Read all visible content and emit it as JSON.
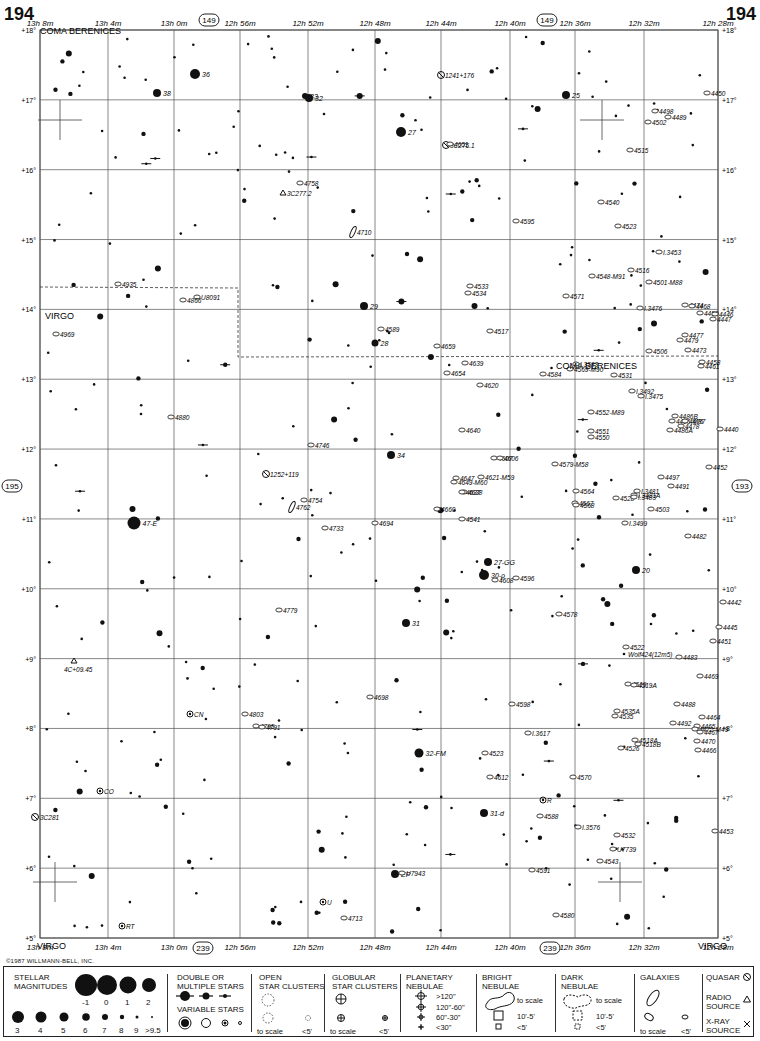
{
  "page": {
    "number_left": "194",
    "number_right": "194",
    "copyright": "©1987 WILLMANN-BELL, INC."
  },
  "chart_data": {
    "type": "scatter",
    "xlabel": "Right Ascension",
    "ylabel": "Declination",
    "ra_ticks_top": [
      "13h 8m",
      "13h 4m",
      "13h 0m",
      "12h 56m",
      "12h 52m",
      "12h 48m",
      "12h 44m",
      "12h 40m",
      "12h 36m",
      "12h 32m",
      "12h 28m"
    ],
    "ra_ticks_bottom": [
      "13h 8m",
      "13h 4m",
      "13h 0m",
      "12h 56m",
      "12h 52m",
      "12h 48m",
      "12h 44m",
      "12h 40m",
      "12h 36m",
      "12h 32m",
      "12h 28m"
    ],
    "dec_ticks": [
      "+18°",
      "+17°",
      "+16°",
      "+15°",
      "+14°",
      "+13°",
      "+12°",
      "+11°",
      "+10°",
      "+9°",
      "+8°",
      "+7°",
      "+6°",
      "+5°"
    ],
    "xlim_ra_min": [
      788,
      748
    ],
    "ylim_dec": [
      5,
      18
    ],
    "grid": true,
    "adjacent_charts": {
      "top": "149",
      "bottom": "239",
      "left": "195",
      "right": "193"
    },
    "constellations": [
      {
        "name": "COMA BERENICES",
        "x": 40,
        "y": 14
      },
      {
        "name": "VIRGO",
        "x": 45,
        "y": 299
      },
      {
        "name": "COMA BERENICES",
        "x": 556,
        "y": 349
      },
      {
        "name": "VIRGO",
        "x": 37,
        "y": 929
      },
      {
        "name": "VIRGO",
        "x": 698,
        "y": 929
      }
    ],
    "labeled_stars": [
      {
        "label": "36",
        "x": 195,
        "y": 74,
        "r": 5
      },
      {
        "label": "38",
        "x": 157,
        "y": 93,
        "r": 4
      },
      {
        "label": "33",
        "x": 305,
        "y": 96,
        "r": 3
      },
      {
        "label": "32",
        "x": 309,
        "y": 98,
        "r": 4
      },
      {
        "label": "25",
        "x": 566,
        "y": 95,
        "r": 4
      },
      {
        "label": "27",
        "x": 401,
        "y": 132,
        "r": 5
      },
      {
        "label": "29",
        "x": 364,
        "y": 306,
        "r": 4
      },
      {
        "label": "28",
        "x": 375,
        "y": 343,
        "r": 3.5
      },
      {
        "label": "34",
        "x": 391,
        "y": 455,
        "r": 4
      },
      {
        "label": "47-E",
        "x": 134,
        "y": 523,
        "r": 6.5
      },
      {
        "label": "27-GG",
        "x": 488,
        "y": 562,
        "r": 4
      },
      {
        "label": "30-ρ",
        "x": 484,
        "y": 575,
        "r": 5
      },
      {
        "label": "20",
        "x": 636,
        "y": 570,
        "r": 4
      },
      {
        "label": "31",
        "x": 406,
        "y": 623,
        "r": 4
      },
      {
        "label": "32-FM",
        "x": 419,
        "y": 753,
        "r": 4.5
      },
      {
        "label": "31-d",
        "x": 484,
        "y": 813,
        "r": 4
      },
      {
        "label": "EP",
        "x": 395,
        "y": 874,
        "r": 4
      }
    ],
    "galaxies": [
      {
        "label": "1241+176",
        "x": 441,
        "y": 75,
        "kind": "quasar"
      },
      {
        "label": "4450",
        "x": 707,
        "y": 93
      },
      {
        "label": "4498",
        "x": 655,
        "y": 111
      },
      {
        "label": "4489",
        "x": 668,
        "y": 117
      },
      {
        "label": "4502",
        "x": 648,
        "y": 122
      },
      {
        "label": "3C275.1",
        "x": 446,
        "y": 145,
        "kind": "quasar"
      },
      {
        "label": "4651",
        "x": 450,
        "y": 144
      },
      {
        "label": "4515",
        "x": 630,
        "y": 150
      },
      {
        "label": "4758",
        "x": 300,
        "y": 183
      },
      {
        "label": "3C277.2",
        "x": 283,
        "y": 193,
        "kind": "radio"
      },
      {
        "label": "4540",
        "x": 601,
        "y": 202
      },
      {
        "label": "4595",
        "x": 516,
        "y": 221
      },
      {
        "label": "4523",
        "x": 618,
        "y": 226
      },
      {
        "label": "4710",
        "x": 353,
        "y": 232,
        "rot": true
      },
      {
        "label": "I.3453",
        "x": 659,
        "y": 252
      },
      {
        "label": "4516",
        "x": 631,
        "y": 270
      },
      {
        "label": "4548-M91",
        "x": 592,
        "y": 276
      },
      {
        "label": "4501-M88",
        "x": 649,
        "y": 282
      },
      {
        "label": "4935",
        "x": 118,
        "y": 284
      },
      {
        "label": "4533",
        "x": 470,
        "y": 286
      },
      {
        "label": "4534",
        "x": 468,
        "y": 293
      },
      {
        "label": "U8091",
        "x": 197,
        "y": 297
      },
      {
        "label": "4866",
        "x": 183,
        "y": 300
      },
      {
        "label": "4571",
        "x": 566,
        "y": 296
      },
      {
        "label": "I.3476",
        "x": 640,
        "y": 308
      },
      {
        "label": "4474",
        "x": 685,
        "y": 305
      },
      {
        "label": "4468",
        "x": 692,
        "y": 306
      },
      {
        "label": "4459",
        "x": 700,
        "y": 313
      },
      {
        "label": "4446",
        "x": 715,
        "y": 314
      },
      {
        "label": "4447",
        "x": 713,
        "y": 319
      },
      {
        "label": "4969",
        "x": 56,
        "y": 334
      },
      {
        "label": "4589",
        "x": 381,
        "y": 329
      },
      {
        "label": "4517",
        "x": 490,
        "y": 331
      },
      {
        "label": "4659",
        "x": 437,
        "y": 346
      },
      {
        "label": "4477",
        "x": 685,
        "y": 335
      },
      {
        "label": "4479",
        "x": 680,
        "y": 340
      },
      {
        "label": "4506",
        "x": 649,
        "y": 351
      },
      {
        "label": "4473",
        "x": 688,
        "y": 350
      },
      {
        "label": "4639",
        "x": 465,
        "y": 363
      },
      {
        "label": "I.3583",
        "x": 576,
        "y": 364
      },
      {
        "label": "4569-M90",
        "x": 570,
        "y": 369
      },
      {
        "label": "4654",
        "x": 447,
        "y": 373
      },
      {
        "label": "4584",
        "x": 543,
        "y": 374
      },
      {
        "label": "4531",
        "x": 614,
        "y": 375
      },
      {
        "label": "4458",
        "x": 702,
        "y": 362
      },
      {
        "label": "4461",
        "x": 701,
        "y": 366
      },
      {
        "label": "4620",
        "x": 480,
        "y": 385
      },
      {
        "label": "I.3492",
        "x": 632,
        "y": 391
      },
      {
        "label": "I.3475",
        "x": 641,
        "y": 396
      },
      {
        "label": "4552-M89",
        "x": 591,
        "y": 412
      },
      {
        "label": "4880",
        "x": 171,
        "y": 417
      },
      {
        "label": "4486B",
        "x": 675,
        "y": 416
      },
      {
        "label": "4486-M87",
        "x": 672,
        "y": 421
      },
      {
        "label": "4476",
        "x": 685,
        "y": 421
      },
      {
        "label": "4486A",
        "x": 670,
        "y": 430
      },
      {
        "label": "4478",
        "x": 681,
        "y": 426
      },
      {
        "label": "4440",
        "x": 720,
        "y": 429
      },
      {
        "label": "4551",
        "x": 591,
        "y": 431
      },
      {
        "label": "4550",
        "x": 591,
        "y": 437
      },
      {
        "label": "4640",
        "x": 462,
        "y": 430
      },
      {
        "label": "4746",
        "x": 311,
        "y": 445
      },
      {
        "label": "4607",
        "x": 494,
        "y": 458
      },
      {
        "label": "4606",
        "x": 500,
        "y": 458
      },
      {
        "label": "4579-M58",
        "x": 555,
        "y": 464
      },
      {
        "label": "4452",
        "x": 709,
        "y": 467
      },
      {
        "label": "4497",
        "x": 661,
        "y": 477
      },
      {
        "label": "1252+119",
        "x": 266,
        "y": 474,
        "kind": "quasar"
      },
      {
        "label": "4647",
        "x": 456,
        "y": 478
      },
      {
        "label": "4621-M59",
        "x": 481,
        "y": 477
      },
      {
        "label": "4649-M60",
        "x": 454,
        "y": 482
      },
      {
        "label": "4638",
        "x": 464,
        "y": 492
      },
      {
        "label": "4637",
        "x": 462,
        "y": 492
      },
      {
        "label": "4564",
        "x": 576,
        "y": 491
      },
      {
        "label": "I.3481A",
        "x": 634,
        "y": 495
      },
      {
        "label": "I.3481",
        "x": 637,
        "y": 491
      },
      {
        "label": "4528",
        "x": 616,
        "y": 498
      },
      {
        "label": "I.3483",
        "x": 634,
        "y": 497
      },
      {
        "label": "4491",
        "x": 671,
        "y": 486
      },
      {
        "label": "4754",
        "x": 304,
        "y": 500
      },
      {
        "label": "4762",
        "x": 292,
        "y": 507,
        "rot": true
      },
      {
        "label": "4567",
        "x": 575,
        "y": 503
      },
      {
        "label": "4568",
        "x": 576,
        "y": 505
      },
      {
        "label": "4660",
        "x": 437,
        "y": 509
      },
      {
        "label": "4503",
        "x": 651,
        "y": 509
      },
      {
        "label": "4694",
        "x": 375,
        "y": 523
      },
      {
        "label": "4541",
        "x": 462,
        "y": 519
      },
      {
        "label": "I.3499",
        "x": 625,
        "y": 523
      },
      {
        "label": "4733",
        "x": 325,
        "y": 528
      },
      {
        "label": "4482",
        "x": 688,
        "y": 536
      },
      {
        "label": "4608",
        "x": 495,
        "y": 580
      },
      {
        "label": "4596",
        "x": 516,
        "y": 578
      },
      {
        "label": "4442",
        "x": 723,
        "y": 602
      },
      {
        "label": "4779",
        "x": 279,
        "y": 610
      },
      {
        "label": "4578",
        "x": 559,
        "y": 614
      },
      {
        "label": "4445",
        "x": 719,
        "y": 627
      },
      {
        "label": "4451",
        "x": 713,
        "y": 641
      },
      {
        "label": "4522",
        "x": 626,
        "y": 647
      },
      {
        "label": "Wolf424(12m5)",
        "x": 624,
        "y": 654,
        "kind": "star"
      },
      {
        "label": "4483",
        "x": 679,
        "y": 657
      },
      {
        "label": "4469",
        "x": 700,
        "y": 676
      },
      {
        "label": "4519",
        "x": 628,
        "y": 684
      },
      {
        "label": "4519A",
        "x": 634,
        "y": 685
      },
      {
        "label": "4698",
        "x": 370,
        "y": 697
      },
      {
        "label": "4488",
        "x": 677,
        "y": 704
      },
      {
        "label": "4598",
        "x": 512,
        "y": 704
      },
      {
        "label": "4803",
        "x": 245,
        "y": 714
      },
      {
        "label": "4535A",
        "x": 617,
        "y": 711
      },
      {
        "label": "4535",
        "x": 615,
        "y": 716
      },
      {
        "label": "4464",
        "x": 702,
        "y": 717
      },
      {
        "label": "4492",
        "x": 673,
        "y": 723
      },
      {
        "label": "4795",
        "x": 256,
        "y": 726
      },
      {
        "label": "4791",
        "x": 262,
        "y": 727
      },
      {
        "label": "4465",
        "x": 697,
        "y": 726
      },
      {
        "label": "4472-M49",
        "x": 695,
        "y": 729
      },
      {
        "label": "4467",
        "x": 700,
        "y": 732
      },
      {
        "label": "I.3617",
        "x": 528,
        "y": 733
      },
      {
        "label": "4518A",
        "x": 635,
        "y": 740
      },
      {
        "label": "4518B",
        "x": 638,
        "y": 744
      },
      {
        "label": "4470",
        "x": 697,
        "y": 741
      },
      {
        "label": "4526",
        "x": 621,
        "y": 748
      },
      {
        "label": "4466",
        "x": 698,
        "y": 750
      },
      {
        "label": "4523",
        "x": 485,
        "y": 753
      },
      {
        "label": "4612",
        "x": 490,
        "y": 777
      },
      {
        "label": "4570",
        "x": 573,
        "y": 777
      },
      {
        "label": "4588",
        "x": 540,
        "y": 816
      },
      {
        "label": "I.3576",
        "x": 578,
        "y": 827
      },
      {
        "label": "4532",
        "x": 617,
        "y": 835
      },
      {
        "label": "4453",
        "x": 715,
        "y": 831
      },
      {
        "label": "U7739",
        "x": 613,
        "y": 849
      },
      {
        "label": "4543",
        "x": 600,
        "y": 861
      },
      {
        "label": "4591",
        "x": 532,
        "y": 870
      },
      {
        "label": "U7943",
        "x": 402,
        "y": 873
      },
      {
        "label": "4580",
        "x": 556,
        "y": 915
      },
      {
        "label": "4713",
        "x": 344,
        "y": 918
      }
    ],
    "variable_stars": [
      {
        "label": "CN",
        "x": 190,
        "y": 714
      },
      {
        "label": "CO",
        "x": 100,
        "y": 791
      },
      {
        "label": "RT",
        "x": 122,
        "y": 926
      },
      {
        "label": "U",
        "x": 323,
        "y": 902
      },
      {
        "label": "R",
        "x": 543,
        "y": 800
      }
    ],
    "radio_sources": [
      {
        "label": "3C277.2",
        "x": 283,
        "y": 193
      },
      {
        "label": "4C+09.45",
        "x": 74,
        "y": 661
      }
    ],
    "quasars": [
      {
        "label": "1241+176",
        "x": 441,
        "y": 75
      },
      {
        "label": "3C275.1",
        "x": 446,
        "y": 145
      },
      {
        "label": "1252+119",
        "x": 266,
        "y": 474
      },
      {
        "label": "3C281",
        "x": 35,
        "y": 817
      }
    ]
  },
  "legend": {
    "stellar_magnitudes": {
      "title_line1": "STELLAR",
      "title_line2": "MAGNITUDES",
      "row1": [
        "-1",
        "0",
        "1",
        "2"
      ],
      "row2": [
        "3",
        "4",
        "5",
        "6",
        "7",
        "8",
        "9",
        ">9.5"
      ]
    },
    "double_stars": {
      "title_line1": "DOUBLE OR",
      "title_line2": "MULTIPLE STARS"
    },
    "variable_stars": {
      "title": "VARIABLE STARS"
    },
    "open_clusters": {
      "title_line1": "OPEN",
      "title_line2": "STAR CLUSTERS",
      "to_scale": "to scale",
      "small": "<5'"
    },
    "globular_clusters": {
      "title_line1": "GLOBULAR",
      "title_line2": "STAR CLUSTERS",
      "to_scale": "to scale",
      "small": "<5'"
    },
    "planetary_nebulae": {
      "title_line1": "PLANETARY",
      "title_line2": "NEBULAE",
      "sizes": [
        ">120\"",
        "120\"-60\"",
        "60\"-30\"",
        "<30\""
      ]
    },
    "bright_nebulae": {
      "title_line1": "BRIGHT",
      "title_line2": "NEBULAE",
      "to_scale": "to scale",
      "mid": "10'-5'",
      "small": "<5'"
    },
    "dark_nebulae": {
      "title_line1": "DARK",
      "title_line2": "NEBULAE",
      "to_scale": "to scale",
      "mid": "10'-5'",
      "small": "<5'"
    },
    "galaxies": {
      "title": "GALAXIES",
      "to_scale": "to scale",
      "small": "<5'"
    },
    "quasar": {
      "label": "QUASAR"
    },
    "radio_source": {
      "line1": "RADIO",
      "line2": "SOURCE"
    },
    "xray_source": {
      "line1": "X-RAY",
      "line2": "SOURCE"
    }
  }
}
